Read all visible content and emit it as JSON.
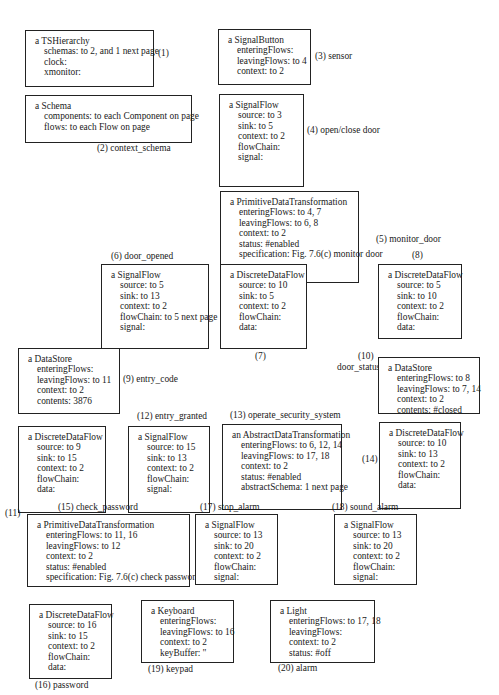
{
  "diagram": {
    "objects": [
      {
        "id": "1",
        "title": "a TSHierarchy",
        "attrs": [
          "schemas: to 2, and 1 next page",
          "clock:",
          "xmonitor:"
        ],
        "label": "(1)"
      },
      {
        "id": "2",
        "title": "a Schema",
        "attrs": [
          "components: to each Component on page",
          "flows: to each Flow on page"
        ],
        "label": "(2) context_schema"
      },
      {
        "id": "3",
        "title": "a SignalButton",
        "attrs": [
          "enteringFlows:",
          "leavingFlows: to 4",
          "context: to 2"
        ],
        "label": "(3) sensor"
      },
      {
        "id": "4",
        "title": "a SignalFlow",
        "attrs": [
          "source: to 3",
          "sink: to 5",
          "context: to 2",
          "flowChain:",
          "signal:"
        ],
        "label": "(4) open/close door"
      },
      {
        "id": "5",
        "title": "a PrimitiveDataTransformation",
        "attrs": [
          "enteringFlows: to 4, 7",
          "leavingFlows: to 6, 8",
          "context: to 2",
          "status: #enabled",
          "specification: Fig. 7.6(c) monitor door"
        ],
        "label": "(5) monitor_door"
      },
      {
        "id": "6",
        "title": "a SignalFlow",
        "attrs": [
          "source: to 5",
          "sink: to 13",
          "context: to 2",
          "flowChain: to 5 next page",
          "signal:"
        ],
        "label": "(6) door_opened"
      },
      {
        "id": "7",
        "title": "a DiscreteDataFlow",
        "attrs": [
          "source: to 10",
          "sink: to 5",
          "context: to 2",
          "flowChain:",
          "data:"
        ],
        "label": "(7)"
      },
      {
        "id": "8",
        "title": "a DiscreteDataFlow",
        "attrs": [
          "source: to 5",
          "sink: to 10",
          "context: to 2",
          "flowChain:",
          "data:"
        ],
        "label": "(8)"
      },
      {
        "id": "9",
        "title": "a DataStore",
        "attrs": [
          "enteringFlows:",
          "leavingFlows: to 11",
          "context: to 2",
          "contents: 3876"
        ],
        "label": "(9) entry_code"
      },
      {
        "id": "10",
        "title": "a DataStore",
        "attrs": [
          "enteringFlows: to 8",
          "leavingFlows: to 7, 14",
          "context: to 2",
          "contents: #closed"
        ],
        "label": "(10)",
        "label2": "door_status"
      },
      {
        "id": "11",
        "title": "a DiscreteDataFlow",
        "attrs": [
          "source: to 9",
          "sink: to 15",
          "context: to 2",
          "flowChain:",
          "data:"
        ],
        "label": "(11)"
      },
      {
        "id": "12",
        "title": "a SignalFlow",
        "attrs": [
          "source: to 15",
          "sink: to 13",
          "context: to 2",
          "flowChain:",
          "signal:"
        ],
        "label": "(12) entry_granted"
      },
      {
        "id": "13",
        "title": "an AbstractDataTransformation",
        "attrs": [
          "enteringFlows: to 6, 12, 14",
          "leavingFlows: to 17, 18",
          "context: to 2",
          "status: #enabled",
          "abstractSchema: 1 next page"
        ],
        "label": "(13) operate_security_system"
      },
      {
        "id": "14",
        "title": "a DiscreteDataFlow",
        "attrs": [
          "source: to 10",
          "sink: to 13",
          "context: to 2",
          "flowChain:",
          "data:"
        ],
        "label": "(14)"
      },
      {
        "id": "15",
        "title": "a PrimitiveDataTransformation",
        "attrs": [
          "enteringFlows: to 11, 16",
          "leavingFlows: to 12",
          "context: to 2",
          "status: #enabled",
          "specification: Fig. 7.6(c) check password"
        ],
        "label": "(15) check_password"
      },
      {
        "id": "16",
        "title": "a DiscreteDataFlow",
        "attrs": [
          "source: to 16",
          "sink: to 15",
          "context: to 2",
          "flowChain:",
          "data:"
        ],
        "label": "(16) password"
      },
      {
        "id": "17",
        "title": "a SignalFlow",
        "attrs": [
          "source: to 13",
          "sink: to 20",
          "context: to 2",
          "flowChain:",
          "signal:"
        ],
        "label": "(17) stop_alarm"
      },
      {
        "id": "18",
        "title": "a SignalFlow",
        "attrs": [
          "source: to 13",
          "sink: to 20",
          "context: to 2",
          "flowChain:",
          "signal:"
        ],
        "label": "(18) sound_alarm"
      },
      {
        "id": "19",
        "title": "a Keyboard",
        "attrs": [
          "enteringFlows:",
          "leavingFlows: to 16",
          "context: to 2",
          "keyBuffer: ''"
        ],
        "label": "(19) keypad"
      },
      {
        "id": "20",
        "title": "a Light",
        "attrs": [
          "enteringFlows: to 17, 18",
          "leavingFlows:",
          "context: to 2",
          "status: #off"
        ],
        "label": "(20) alarm"
      }
    ]
  }
}
